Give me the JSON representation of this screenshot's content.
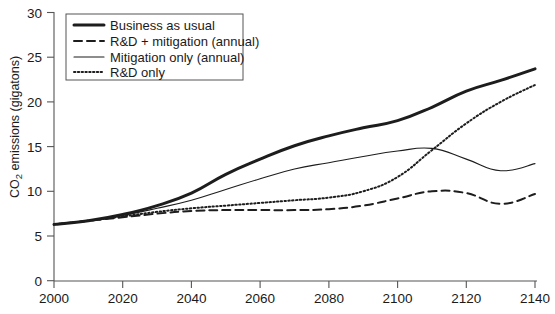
{
  "chart_data": {
    "type": "line",
    "title": "",
    "xlabel": "",
    "ylabel": "CO2 emissions (gigatons)",
    "ylabel_parts": {
      "pre": "CO",
      "sub": "2",
      "post": " emissions (gigatons)"
    },
    "xlim": [
      2000,
      2140
    ],
    "ylim": [
      0,
      30
    ],
    "grid": false,
    "legend_position": "top-left",
    "xticks": [
      2000,
      2020,
      2040,
      2060,
      2080,
      2100,
      2120,
      2140
    ],
    "yticks": [
      0,
      5,
      10,
      15,
      20,
      25,
      30
    ],
    "xtick_labels": [
      "2000",
      "2020",
      "2040",
      "2060",
      "2080",
      "2100",
      "2120",
      "2140"
    ],
    "ytick_labels": [
      "0",
      "5",
      "10",
      "15",
      "20",
      "25",
      "30"
    ],
    "x": [
      2000,
      2010,
      2020,
      2030,
      2040,
      2050,
      2060,
      2070,
      2080,
      2090,
      2100,
      2110,
      2120,
      2130,
      2140
    ],
    "series": [
      {
        "name": "Business as usual",
        "style": "solid-thick",
        "color": "#1d1d1d",
        "width": 3.0,
        "dash": "none",
        "values": [
          6.3,
          6.7,
          7.4,
          8.4,
          9.8,
          11.9,
          13.6,
          15.1,
          16.2,
          17.1,
          17.9,
          19.4,
          21.2,
          22.4,
          23.7
        ]
      },
      {
        "name": "R&D + mitigation (annual)",
        "style": "dashed",
        "color": "#1d1d1d",
        "width": 2.0,
        "dash": "8,5",
        "values": [
          6.3,
          6.7,
          7.1,
          7.5,
          7.8,
          7.9,
          7.9,
          7.9,
          8.0,
          8.4,
          9.2,
          10.0,
          9.8,
          8.6,
          9.7
        ]
      },
      {
        "name": "Mitigation only (annual)",
        "style": "solid-thin",
        "color": "#1d1d1d",
        "width": 1.1,
        "dash": "none",
        "values": [
          6.3,
          6.7,
          7.3,
          8.1,
          9.0,
          10.2,
          11.4,
          12.5,
          13.2,
          13.9,
          14.5,
          14.8,
          13.6,
          12.3,
          13.1
        ]
      },
      {
        "name": "R&D only",
        "style": "dotted",
        "color": "#1d1d1d",
        "width": 2.0,
        "dash": "1.4,2.4",
        "values": [
          6.3,
          6.7,
          7.2,
          7.7,
          8.1,
          8.4,
          8.7,
          9.0,
          9.3,
          10.0,
          11.6,
          14.6,
          17.6,
          20.0,
          21.9
        ]
      }
    ],
    "annotations": []
  },
  "legend": {
    "entries": [
      {
        "label": "Business as usual"
      },
      {
        "label": "R&D + mitigation (annual)"
      },
      {
        "label": "Mitigation only (annual)"
      },
      {
        "label": "R&D only"
      }
    ]
  }
}
